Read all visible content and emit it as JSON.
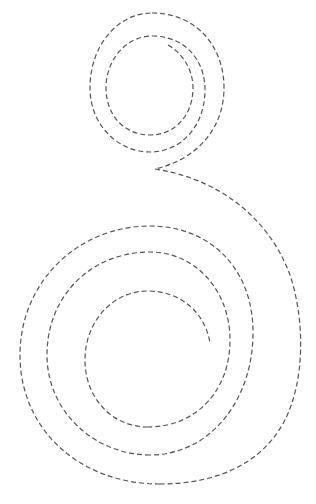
{
  "figure": {
    "background": "#ffffff",
    "stroke_color": "#555555",
    "stroke_width": 1.2,
    "dash_pattern": "5 3",
    "parts": [
      {
        "name": "upper-spiral",
        "center": [
          153,
          86
        ],
        "turns": 2.3,
        "outer_radius": 70
      },
      {
        "name": "connecting-curve",
        "from": [
          155,
          169
        ],
        "to": [
          302,
          380
        ]
      },
      {
        "name": "lower-spiral",
        "center": [
          150,
          358
        ],
        "turns": 2.6,
        "outer_radius": 135
      }
    ]
  }
}
